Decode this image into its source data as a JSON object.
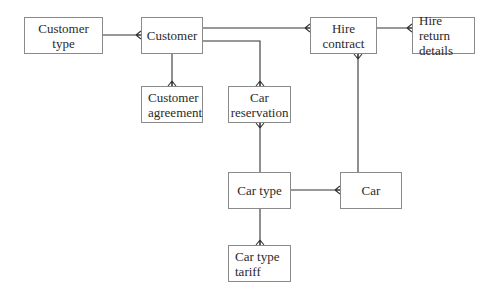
{
  "diagram": {
    "type": "entity-relationship",
    "entities": [
      {
        "id": "customer_type",
        "label": "Customer type"
      },
      {
        "id": "customer",
        "label": "Customer"
      },
      {
        "id": "hire_contract",
        "label": "Hire contract"
      },
      {
        "id": "hire_return_details",
        "label": "Hire return details"
      },
      {
        "id": "customer_agreement",
        "label": "Customer agreement"
      },
      {
        "id": "car_reservation",
        "label": "Car reservation"
      },
      {
        "id": "car_type",
        "label": "Car type"
      },
      {
        "id": "car",
        "label": "Car"
      },
      {
        "id": "car_type_tariff",
        "label": "Car type tariff"
      }
    ],
    "relationships": [
      {
        "from": "customer_type",
        "to": "customer",
        "cardinality": "one-to-many"
      },
      {
        "from": "customer",
        "to": "hire_contract",
        "cardinality": "one-to-many"
      },
      {
        "from": "hire_contract",
        "to": "hire_return_details",
        "cardinality": "one-to-many"
      },
      {
        "from": "customer",
        "to": "customer_agreement",
        "cardinality": "one-to-many"
      },
      {
        "from": "customer",
        "to": "car_reservation",
        "cardinality": "one-to-many"
      },
      {
        "from": "car_type",
        "to": "car_reservation",
        "cardinality": "one-to-many"
      },
      {
        "from": "car",
        "to": "hire_contract",
        "cardinality": "one-to-many"
      },
      {
        "from": "car_type",
        "to": "car",
        "cardinality": "one-to-many"
      },
      {
        "from": "car_type",
        "to": "car_type_tariff",
        "cardinality": "one-to-many"
      }
    ]
  }
}
